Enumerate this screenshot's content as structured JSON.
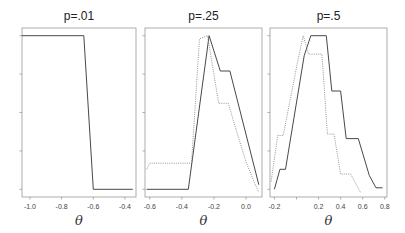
{
  "figure": {
    "width": 405,
    "height": 233,
    "colors": {
      "solid": "#333333",
      "dotted": "#888888",
      "frame": "#999999"
    }
  },
  "chart_data": [
    {
      "type": "line",
      "title": "p=.01",
      "xlabel": "θ",
      "ylabel": "",
      "xlim": [
        -1.05,
        -0.33
      ],
      "ylim": [
        -0.05,
        1.05
      ],
      "xticks": [
        -1.0,
        -0.8,
        -0.6,
        -0.4
      ],
      "xtick_labels": [
        "-1.0",
        "-0.8",
        "-0.6",
        "-0.4"
      ],
      "yticks": [
        0,
        0.25,
        0.5,
        0.75,
        1.0
      ],
      "ytick_labels": [
        "",
        "",
        "",
        "",
        ""
      ],
      "grid": false,
      "frame": {
        "left": 22,
        "top": 28,
        "right": 136,
        "bottom": 197
      },
      "series": [
        {
          "name": "solid",
          "style": "solid",
          "x": [
            -1.05,
            -0.66,
            -0.6,
            -0.35
          ],
          "y": [
            1.0,
            1.0,
            0.0,
            0.0
          ]
        }
      ]
    },
    {
      "type": "line",
      "title": "p=.25",
      "xlabel": "θ",
      "ylabel": "",
      "xlim": [
        -0.63,
        0.1
      ],
      "ylim": [
        -0.05,
        1.05
      ],
      "xticks": [
        -0.6,
        -0.4,
        -0.2,
        0.0
      ],
      "xtick_labels": [
        "-0.6",
        "-0.4",
        "-0.2",
        "0.0"
      ],
      "yticks": [
        0,
        0.25,
        0.5,
        0.75,
        1.0
      ],
      "ytick_labels": [
        "",
        "",
        "",
        "",
        ""
      ],
      "grid": false,
      "frame": {
        "left": 145,
        "top": 28,
        "right": 262,
        "bottom": 197
      },
      "series": [
        {
          "name": "solid",
          "style": "solid",
          "x": [
            -0.62,
            -0.36,
            -0.23,
            -0.16,
            -0.1,
            0.08
          ],
          "y": [
            0.0,
            0.0,
            1.0,
            0.77,
            0.77,
            0.03
          ]
        },
        {
          "name": "dotted",
          "style": "dotted",
          "x": [
            -0.62,
            -0.6,
            -0.34,
            -0.29,
            -0.24,
            -0.17,
            -0.11,
            -0.06,
            0.0,
            0.05,
            0.08
          ],
          "y": [
            0.13,
            0.17,
            0.17,
            0.98,
            1.0,
            0.56,
            0.56,
            0.38,
            0.18,
            0.05,
            -0.02
          ]
        }
      ]
    },
    {
      "type": "line",
      "title": "p=.5",
      "xlabel": "θ",
      "ylabel": "",
      "xlim": [
        -0.24,
        0.82
      ],
      "ylim": [
        -0.05,
        1.05
      ],
      "xticks": [
        -0.2,
        0.0,
        0.2,
        0.4,
        0.6,
        0.8
      ],
      "xtick_labels": [
        "-0.2",
        "",
        "0.2",
        "0.4",
        "0.6",
        "0.8"
      ],
      "yticks": [
        0,
        0.25,
        0.5,
        0.75,
        1.0
      ],
      "ytick_labels": [
        "",
        "",
        "",
        "",
        ""
      ],
      "grid": false,
      "frame": {
        "left": 270,
        "top": 28,
        "right": 387,
        "bottom": 197
      },
      "series": [
        {
          "name": "solid",
          "style": "solid",
          "x": [
            -0.2,
            -0.15,
            -0.1,
            0.07,
            0.13,
            0.27,
            0.32,
            0.4,
            0.45,
            0.56,
            0.66,
            0.72,
            0.78
          ],
          "y": [
            0.0,
            0.13,
            0.13,
            0.87,
            1.0,
            1.0,
            0.64,
            0.64,
            0.33,
            0.33,
            0.09,
            0.01,
            0.01
          ]
        },
        {
          "name": "dotted",
          "style": "dotted",
          "x": [
            -0.23,
            -0.17,
            -0.12,
            0.01,
            0.06,
            0.11,
            0.23,
            0.28,
            0.34,
            0.4,
            0.49,
            0.58
          ],
          "y": [
            0.05,
            0.35,
            0.35,
            0.83,
            1.0,
            0.88,
            0.88,
            0.36,
            0.36,
            0.1,
            0.1,
            -0.02
          ]
        }
      ]
    }
  ]
}
